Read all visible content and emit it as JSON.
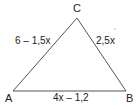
{
  "diagram": {
    "type": "triangle",
    "vertices": {
      "A": {
        "label": "A"
      },
      "B": {
        "label": "B"
      },
      "C": {
        "label": "C"
      }
    },
    "sides": {
      "AC": {
        "label": "6 – 1,5x"
      },
      "BC": {
        "label": "2,5x"
      },
      "AB": {
        "label": "4x – 1,2"
      }
    },
    "colors": {
      "stroke": "#555555",
      "text": "#222222"
    }
  }
}
